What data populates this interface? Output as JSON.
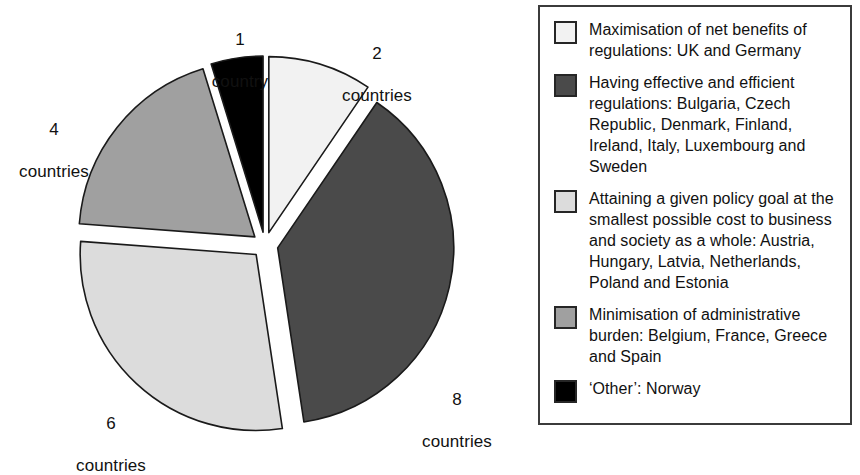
{
  "chart_data": {
    "type": "pie",
    "title": "",
    "subtitle": "",
    "xlabel": "",
    "ylabel": "",
    "unit": "countries",
    "total": 21,
    "legend_position": "right",
    "grid": false,
    "exploded": true,
    "categories": [
      "Maximisation of net benefits of regulations",
      "Having effective and efficient regulations",
      "Attaining a given policy goal at the smallest possible cost to business and society as a whole",
      "Minimisation of administrative burden",
      "'Other'"
    ],
    "values": [
      2,
      8,
      6,
      4,
      1
    ],
    "colors": [
      "#f2f2f2",
      "#4a4a4a",
      "#dcdcdc",
      "#a0a0a0",
      "#000000"
    ],
    "data_labels": [
      "2 countries",
      "8 countries",
      "6 countries",
      "4 countries",
      "1 country"
    ],
    "slices": [
      {
        "label": "2 countries",
        "count_text": "2",
        "unit_text": "countries",
        "value": 2,
        "color": "#f2f2f2",
        "start_angle": 0,
        "end_angle": 34.3,
        "countries": [
          "UK",
          "Germany"
        ]
      },
      {
        "label": "8 countries",
        "count_text": "8",
        "unit_text": "countries",
        "value": 8,
        "color": "#4a4a4a",
        "start_angle": 34.3,
        "end_angle": 171.4,
        "countries": [
          "Bulgaria",
          "Czech Republic",
          "Denmark",
          "Finland",
          "Ireland",
          "Italy",
          "Luxembourg",
          "Sweden"
        ]
      },
      {
        "label": "6 countries",
        "count_text": "6",
        "unit_text": "countries",
        "value": 6,
        "color": "#dcdcdc",
        "start_angle": 171.4,
        "end_angle": 274.3,
        "countries": [
          "Austria",
          "Hungary",
          "Latvia",
          "Netherlands",
          "Poland",
          "Estonia"
        ]
      },
      {
        "label": "4 countries",
        "count_text": "4",
        "unit_text": "countries",
        "value": 4,
        "color": "#a0a0a0",
        "start_angle": 274.3,
        "end_angle": 342.9,
        "countries": [
          "Belgium",
          "France",
          "Greece",
          "Spain"
        ]
      },
      {
        "label": "1 country",
        "count_text": "1",
        "unit_text": "country",
        "value": 1,
        "color": "#000000",
        "start_angle": 342.9,
        "end_angle": 360,
        "countries": [
          "Norway"
        ]
      }
    ],
    "legend": [
      {
        "swatch_color": "#f2f2f2",
        "text": "Maximisation of net benefits of regulations: UK and Germany"
      },
      {
        "swatch_color": "#4a4a4a",
        "text": "Having effective and efficient regulations: Bulgaria, Czech Republic, Denmark, Finland, Ireland, Italy, Luxembourg and Sweden"
      },
      {
        "swatch_color": "#dcdcdc",
        "text": "Attaining a given policy goal at the smallest possible cost to business and society as a whole: Austria, Hungary, Latvia, Netherlands, Poland and Estonia"
      },
      {
        "swatch_color": "#a0a0a0",
        "text": "Minimisation of administrative burden: Belgium, France, Greece and Spain"
      },
      {
        "swatch_color": "#000000",
        "text": "‘Other’: Norway"
      }
    ]
  }
}
